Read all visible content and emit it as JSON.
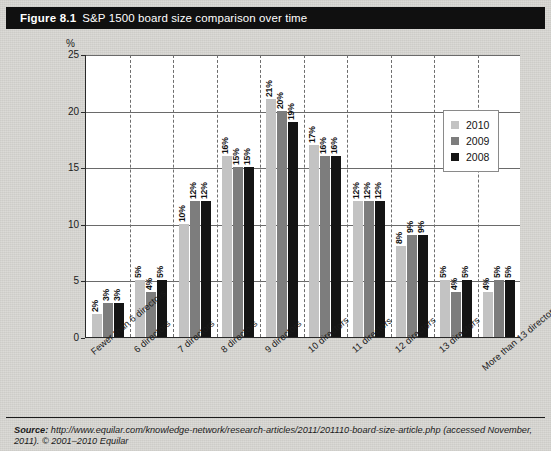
{
  "figure": {
    "number": "Figure 8.1",
    "title": "S&P 1500 board size comparison over time"
  },
  "source": {
    "label": "Source:",
    "text": "http://www.equilar.com/knowledge-network/research-articles/2011/201110-board-size-article.php (accessed November,",
    "line2": "2011). © 2001–2010 Equilar"
  },
  "chart_data": {
    "type": "bar",
    "title": "S&P 1500 board size comparison over time",
    "xlabel": "",
    "ylabel": "%",
    "ylim": [
      0,
      25
    ],
    "yticks": [
      0,
      5,
      10,
      15,
      20,
      25
    ],
    "ytick_labels": [
      "0",
      "5",
      "10",
      "15",
      "20",
      "25"
    ],
    "grid": true,
    "legend_position": "upper-right",
    "value_suffix": "%",
    "categories": [
      "Fewer than 6 directors",
      "6 directors",
      "7 directors",
      "8 directors",
      "9 directors",
      "10 directors",
      "11 directors",
      "12 directors",
      "13 directors",
      "More than 13 directors"
    ],
    "series": [
      {
        "name": "2010",
        "color": "#c3c3c3",
        "values": [
          2,
          5,
          10,
          16,
          21,
          17,
          12,
          8,
          5,
          4
        ],
        "labels": [
          "2%",
          "5%",
          "10%",
          "16%",
          "21%",
          "17%",
          "12%",
          "8%",
          "5%",
          "4%"
        ]
      },
      {
        "name": "2009",
        "color": "#7d7d7d",
        "values": [
          3,
          4,
          12,
          15,
          20,
          16,
          12,
          9,
          4,
          5
        ],
        "labels": [
          "3%",
          "4%",
          "12%",
          "15%",
          "20%",
          "16%",
          "12%",
          "9%",
          "4%",
          "5%"
        ]
      },
      {
        "name": "2008",
        "color": "#141414",
        "values": [
          3,
          5,
          12,
          15,
          19,
          16,
          12,
          9,
          5,
          5
        ],
        "labels": [
          "3%",
          "5%",
          "12%",
          "15%",
          "19%",
          "16%",
          "12%",
          "9%",
          "5%",
          "5%"
        ]
      }
    ]
  }
}
